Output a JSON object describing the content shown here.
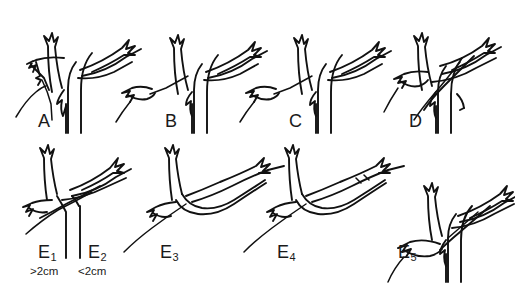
{
  "figure": {
    "type": "anatomical-line-diagram",
    "title": "",
    "background_color": "#ffffff",
    "stroke_color": "#111111",
    "width": 515,
    "height": 288,
    "rows": 2,
    "panels_per_row": [
      4,
      5
    ]
  },
  "panels": [
    {
      "id": "A",
      "label": "A",
      "subscript": "",
      "row": 1,
      "column": 1,
      "label_x": 38,
      "label_y": 112,
      "note": ""
    },
    {
      "id": "B",
      "label": "B",
      "subscript": "",
      "row": 1,
      "column": 2,
      "label_x": 165,
      "label_y": 112,
      "note": ""
    },
    {
      "id": "C",
      "label": "C",
      "subscript": "",
      "row": 1,
      "column": 3,
      "label_x": 289,
      "label_y": 112,
      "note": ""
    },
    {
      "id": "D",
      "label": "D",
      "subscript": "",
      "row": 1,
      "column": 4,
      "label_x": 409,
      "label_y": 112,
      "note": ""
    },
    {
      "id": "E1",
      "label": "E",
      "subscript": "1",
      "row": 2,
      "column": 1,
      "label_x": 38,
      "label_y": 243,
      "note": ">2cm",
      "note_x": 30,
      "note_y": 266
    },
    {
      "id": "E2",
      "label": "E",
      "subscript": "2",
      "row": 2,
      "column": 2,
      "label_x": 88,
      "label_y": 243,
      "note": "<2cm",
      "note_x": 78,
      "note_y": 266
    },
    {
      "id": "E3",
      "label": "E",
      "subscript": "3",
      "row": 2,
      "column": 3,
      "label_x": 160,
      "label_y": 243,
      "note": ""
    },
    {
      "id": "E4",
      "label": "E",
      "subscript": "4",
      "row": 2,
      "column": 4,
      "label_x": 277,
      "label_y": 243,
      "note": ""
    },
    {
      "id": "E5",
      "label": "E",
      "subscript": "5",
      "row": 2,
      "column": 5,
      "label_x": 398,
      "label_y": 243,
      "note": ""
    }
  ],
  "annotations": {
    "size_notes": [
      ">2cm",
      "<2cm"
    ]
  }
}
